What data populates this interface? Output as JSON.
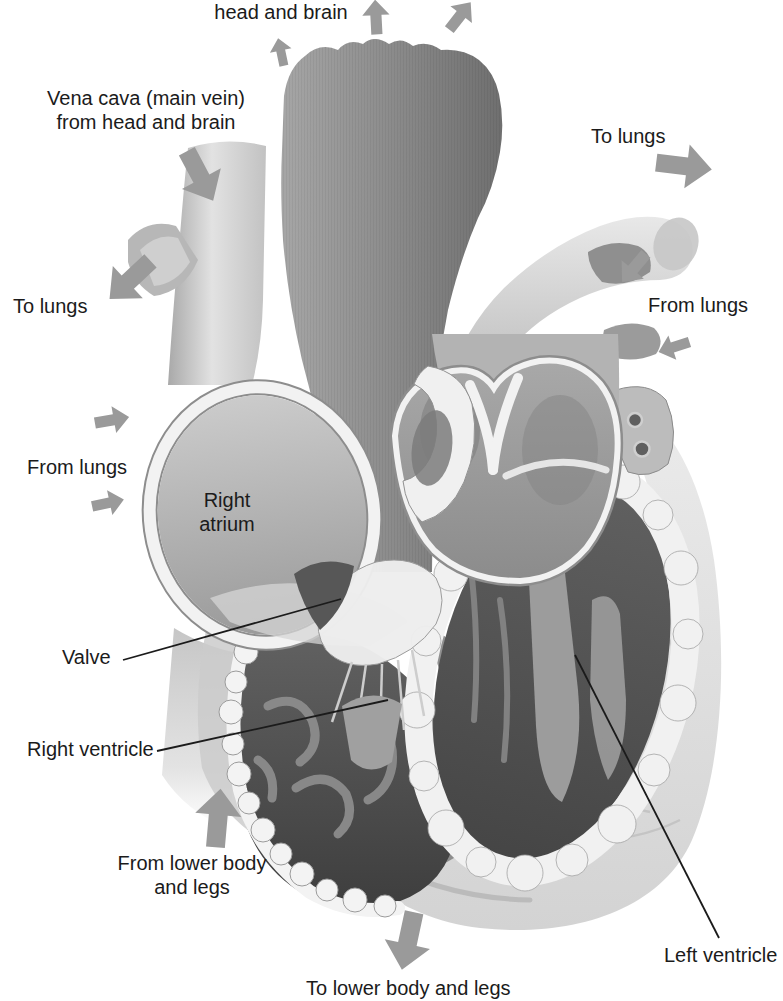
{
  "figure": {
    "background": "#ffffff"
  },
  "labels": {
    "head_and_brain": "head and brain",
    "vena_cava_line1": "Vena cava (main vein)",
    "vena_cava_line2": "from head and brain",
    "to_lungs_left": "To lungs",
    "to_lungs_right": "To lungs",
    "from_lungs_left": "From lungs",
    "from_lungs_right": "From lungs",
    "right_atrium_line1": "Right",
    "right_atrium_line2": "atrium",
    "valve": "Valve",
    "right_ventricle": "Right ventricle",
    "from_lower_body_line1": "From lower body",
    "from_lower_body_line2": "and legs",
    "left_ventricle": "Left ventricle",
    "to_lower_body": "To lower body and legs"
  },
  "colors": {
    "label_text": "#1b1b1b",
    "leader_line": "#1b1b1b",
    "arrow": "#9a9a9a"
  },
  "arrows": [
    {
      "name": "flow-arrow-to-head-left",
      "x": 281,
      "y": 52,
      "rot": -12,
      "scale": 0.5
    },
    {
      "name": "flow-arrow-to-head-mid",
      "x": 376,
      "y": 17,
      "rot": -3,
      "scale": 0.62
    },
    {
      "name": "flow-arrow-to-head-right",
      "x": 460,
      "y": 16,
      "rot": 38,
      "scale": 0.62
    },
    {
      "name": "flow-arrow-vena-cava-in",
      "x": 200,
      "y": 176,
      "rot": 152,
      "scale": 1
    },
    {
      "name": "flow-arrow-to-lungs-left",
      "x": 130,
      "y": 280,
      "rot": 227,
      "scale": 1
    },
    {
      "name": "flow-arrow-from-lungs-left-upper",
      "x": 112,
      "y": 420,
      "rot": 80,
      "scale": 0.62
    },
    {
      "name": "flow-arrow-from-lungs-left-lower",
      "x": 108,
      "y": 503,
      "rot": 78,
      "scale": 0.58
    },
    {
      "name": "flow-arrow-to-lungs-right",
      "x": 684,
      "y": 166,
      "rot": 97,
      "scale": 1
    },
    {
      "name": "flow-arrow-from-lungs-right-upper",
      "x": 634,
      "y": 268,
      "rot": 220,
      "scale": 0.66
    },
    {
      "name": "flow-arrow-from-lungs-right-lower",
      "x": 674,
      "y": 347,
      "rot": 252,
      "scale": 0.58
    },
    {
      "name": "flow-arrow-from-lower-body",
      "x": 218,
      "y": 818,
      "rot": 5,
      "scale": 1.05
    },
    {
      "name": "flow-arrow-to-lower-body",
      "x": 408,
      "y": 941,
      "rot": 192,
      "scale": 1.05
    }
  ],
  "leader_lines": [
    {
      "name": "valve-leader-line",
      "x1": 123,
      "y1": 660,
      "x2": 341,
      "y2": 599
    },
    {
      "name": "right-ventricle-leader-line",
      "x1": 157,
      "y1": 751,
      "x2": 388,
      "y2": 700
    },
    {
      "name": "left-ventricle-leader-line",
      "x1": 719,
      "y1": 938,
      "x2": 575,
      "y2": 655
    }
  ]
}
